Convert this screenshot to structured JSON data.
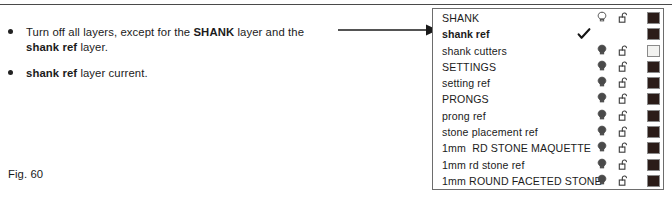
{
  "figure": {
    "caption": "Fig. 60"
  },
  "instructions": {
    "bullets": [
      {
        "id": "bullet-turn-off-layers",
        "segments": [
          {
            "text": "Turn off all layers, except for the ",
            "bold": false
          },
          {
            "text": "SHANK",
            "bold": true
          },
          {
            "text": " layer and the ",
            "bold": false
          },
          {
            "text": "shank ref",
            "bold": true
          },
          {
            "text": " layer.",
            "bold": false
          }
        ]
      },
      {
        "id": "bullet-current-layer",
        "segments": [
          {
            "text": "shank ref",
            "bold": true
          },
          {
            "text": " layer current.",
            "bold": false
          }
        ]
      }
    ]
  },
  "annotation": {
    "arrow": {
      "icon": "arrow-right-icon",
      "points_to_row": "shank ref",
      "color": "#1a1a1a"
    }
  },
  "layer_palette": {
    "border_color": "#6d6d6d",
    "background": "#ffffff",
    "columns": [
      "name",
      "current-check",
      "visibility-bulb",
      "lock",
      "color-swatch"
    ],
    "rows": [
      {
        "name": "SHANK",
        "current": false,
        "check": false,
        "bulb": "off",
        "bulb_icon": "lightbulb-off-icon",
        "lock": "unlocked",
        "lock_icon": "padlock-open-icon",
        "color": "#2b1c18"
      },
      {
        "name": "shank ref",
        "current": true,
        "check": true,
        "bulb": "none",
        "bulb_icon": "",
        "lock": "none",
        "lock_icon": "",
        "color": "#2b1c18"
      },
      {
        "name": "shank cutters",
        "current": false,
        "check": false,
        "bulb": "on",
        "bulb_icon": "lightbulb-on-icon",
        "lock": "unlocked",
        "lock_icon": "padlock-open-icon",
        "color": "#f2f2f0"
      },
      {
        "name": "SETTINGS",
        "current": false,
        "check": false,
        "bulb": "on",
        "bulb_icon": "lightbulb-on-icon",
        "lock": "unlocked",
        "lock_icon": "padlock-open-icon",
        "color": "#2b1c18"
      },
      {
        "name": "setting ref",
        "current": false,
        "check": false,
        "bulb": "on",
        "bulb_icon": "lightbulb-on-icon",
        "lock": "unlocked",
        "lock_icon": "padlock-open-icon",
        "color": "#2b1c18"
      },
      {
        "name": "PRONGS",
        "current": false,
        "check": false,
        "bulb": "on",
        "bulb_icon": "lightbulb-on-icon",
        "lock": "unlocked",
        "lock_icon": "padlock-open-icon",
        "color": "#2b1c18"
      },
      {
        "name": "prong ref",
        "current": false,
        "check": false,
        "bulb": "on",
        "bulb_icon": "lightbulb-on-icon",
        "lock": "unlocked",
        "lock_icon": "padlock-open-icon",
        "color": "#2b1c18"
      },
      {
        "name": "stone placement ref",
        "current": false,
        "check": false,
        "bulb": "on",
        "bulb_icon": "lightbulb-on-icon",
        "lock": "unlocked",
        "lock_icon": "padlock-open-icon",
        "color": "#2b1c18"
      },
      {
        "name": "1mm  RD STONE MAQUETTE",
        "current": false,
        "check": false,
        "bulb": "on",
        "bulb_icon": "lightbulb-on-icon",
        "lock": "unlocked",
        "lock_icon": "padlock-open-icon",
        "color": "#2b1c18"
      },
      {
        "name": "1mm rd stone ref",
        "current": false,
        "check": false,
        "bulb": "on",
        "bulb_icon": "lightbulb-on-icon",
        "lock": "unlocked",
        "lock_icon": "padlock-open-icon",
        "color": "#2b1c18"
      },
      {
        "name": "1mm ROUND FACETED STONE",
        "current": false,
        "check": false,
        "bulb": "on",
        "bulb_icon": "lightbulb-on-icon",
        "lock": "unlocked",
        "lock_icon": "padlock-open-icon",
        "color": "#2b1c18"
      }
    ]
  }
}
